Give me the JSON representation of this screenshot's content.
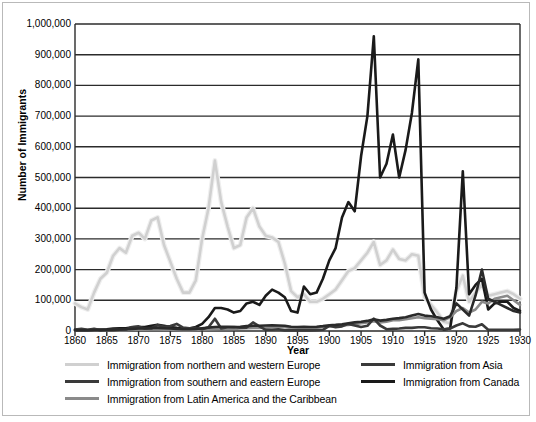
{
  "chart_data": {
    "type": "line",
    "title": "",
    "xlabel": "Year",
    "ylabel": "Number of Immigrants",
    "xlim": [
      1860,
      1930
    ],
    "ylim": [
      0,
      1000000
    ],
    "grid": true,
    "legend_position": "bottom",
    "yticks": [
      "0",
      "100,000",
      "200,000",
      "300,000",
      "400,000",
      "500,000",
      "600,000",
      "700,000",
      "800,000",
      "900,000",
      "1,000,000"
    ],
    "ytick_values": [
      0,
      100000,
      200000,
      300000,
      400000,
      500000,
      600000,
      700000,
      800000,
      900000,
      1000000
    ],
    "xticks": [
      "1860",
      "1865",
      "1870",
      "1875",
      "1880",
      "1885",
      "1890",
      "1895",
      "1900",
      "1905",
      "1910",
      "1915",
      "1920",
      "1925",
      "1930"
    ],
    "xtick_values": [
      1860,
      1865,
      1870,
      1875,
      1880,
      1885,
      1890,
      1895,
      1900,
      1905,
      1910,
      1915,
      1920,
      1925,
      1930
    ],
    "x": [
      1860,
      1861,
      1862,
      1863,
      1864,
      1865,
      1866,
      1867,
      1868,
      1869,
      1870,
      1871,
      1872,
      1873,
      1874,
      1875,
      1876,
      1877,
      1878,
      1879,
      1880,
      1881,
      1882,
      1883,
      1884,
      1885,
      1886,
      1887,
      1888,
      1889,
      1890,
      1891,
      1892,
      1893,
      1894,
      1895,
      1896,
      1897,
      1898,
      1899,
      1900,
      1901,
      1902,
      1903,
      1904,
      1905,
      1906,
      1907,
      1908,
      1909,
      1910,
      1911,
      1912,
      1913,
      1914,
      1915,
      1916,
      1917,
      1918,
      1919,
      1920,
      1921,
      1922,
      1923,
      1924,
      1925,
      1926,
      1927,
      1928,
      1929,
      1930
    ],
    "series": [
      {
        "name": "Immigration from northern and western Europe",
        "color": "#d0d0d0",
        "width": 2.6,
        "values": [
          90000,
          78000,
          70000,
          125000,
          170000,
          190000,
          245000,
          270000,
          255000,
          310000,
          320000,
          300000,
          360000,
          370000,
          280000,
          225000,
          170000,
          125000,
          125000,
          165000,
          300000,
          400000,
          555000,
          420000,
          340000,
          270000,
          280000,
          370000,
          400000,
          340000,
          310000,
          305000,
          290000,
          220000,
          130000,
          110000,
          120000,
          95000,
          95000,
          105000,
          120000,
          135000,
          165000,
          195000,
          205000,
          230000,
          255000,
          290000,
          215000,
          230000,
          265000,
          235000,
          230000,
          250000,
          245000,
          110000,
          85000,
          60000,
          30000,
          25000,
          130000,
          180000,
          95000,
          125000,
          150000,
          115000,
          120000,
          125000,
          130000,
          120000,
          105000
        ]
      },
      {
        "name": "Immigration from southern and eastern Europe",
        "color": "#1a1a1a",
        "width": 2.6,
        "values": [
          4000,
          4000,
          3000,
          4000,
          5000,
          6000,
          8000,
          9000,
          9000,
          12000,
          13000,
          13000,
          17000,
          20000,
          17000,
          13000,
          10000,
          8000,
          8000,
          13000,
          23000,
          45000,
          75000,
          75000,
          70000,
          60000,
          65000,
          90000,
          95000,
          85000,
          115000,
          135000,
          125000,
          110000,
          65000,
          60000,
          145000,
          120000,
          125000,
          170000,
          230000,
          270000,
          370000,
          420000,
          390000,
          570000,
          700000,
          960000,
          500000,
          545000,
          640000,
          500000,
          590000,
          710000,
          885000,
          125000,
          70000,
          35000,
          5000,
          8000,
          140000,
          520000,
          120000,
          150000,
          170000,
          70000,
          90000,
          95000,
          95000,
          75000,
          65000
        ]
      },
      {
        "name": "Immigration from Latin America and the Caribbean",
        "color": "#8a8a8a",
        "width": 2.6,
        "values": [
          1500,
          1500,
          1500,
          2000,
          2000,
          2500,
          3000,
          3000,
          3000,
          4000,
          4000,
          4000,
          5000,
          5000,
          4500,
          4000,
          3500,
          3000,
          3000,
          3500,
          4000,
          5000,
          6000,
          7000,
          7000,
          7000,
          8000,
          9000,
          10000,
          10000,
          11000,
          12000,
          12000,
          12000,
          10000,
          10000,
          11000,
          10000,
          11000,
          13000,
          15000,
          16000,
          18000,
          20000,
          22000,
          25000,
          28000,
          32000,
          28000,
          30000,
          35000,
          35000,
          38000,
          42000,
          45000,
          42000,
          40000,
          38000,
          35000,
          45000,
          65000,
          75000,
          60000,
          70000,
          95000,
          90000,
          105000,
          110000,
          115000,
          100000,
          85000
        ]
      },
      {
        "name": "Immigration from Asia",
        "color": "#3a3a3a",
        "width": 2.6,
        "values": [
          5000,
          7000,
          4000,
          7000,
          3000,
          3000,
          3000,
          4000,
          5000,
          13000,
          15000,
          8000,
          8000,
          20000,
          14000,
          16000,
          23000,
          11000,
          9000,
          10000,
          6000,
          12000,
          40000,
          8000,
          12000,
          13000,
          11000,
          11000,
          28000,
          15000,
          4000,
          4000,
          6000,
          2000,
          2000,
          2000,
          2000,
          2000,
          3000,
          4000,
          17000,
          12000,
          15000,
          23000,
          18000,
          13000,
          17000,
          40000,
          18000,
          6000,
          7000,
          8000,
          10000,
          10000,
          12000,
          12000,
          9000,
          8000,
          6000,
          8000,
          18000,
          25000,
          15000,
          14000,
          22000,
          4000,
          4000,
          4000,
          4000,
          4000,
          5000
        ]
      },
      {
        "name": "Immigration from Canada",
        "color": "#2a2a2a",
        "width": 2.6,
        "values": [
          2000,
          2000,
          2000,
          3000,
          3000,
          4000,
          5000,
          6000,
          6000,
          7000,
          8000,
          8000,
          10000,
          10000,
          9000,
          8000,
          7000,
          6000,
          6000,
          7000,
          9000,
          11000,
          13000,
          14000,
          14000,
          13000,
          14000,
          16000,
          17000,
          17000,
          18000,
          19000,
          18000,
          17000,
          14000,
          13000,
          14000,
          13000,
          14000,
          16000,
          19000,
          20000,
          22000,
          25000,
          28000,
          30000,
          33000,
          38000,
          34000,
          36000,
          40000,
          42000,
          45000,
          50000,
          55000,
          50000,
          48000,
          45000,
          40000,
          48000,
          90000,
          70000,
          50000,
          115000,
          200000,
          105000,
          95000,
          85000,
          75000,
          65000,
          60000
        ]
      }
    ]
  },
  "legend": {
    "left_column": [
      {
        "label": "Immigration from northern and western Europe",
        "color": "#d0d0d0"
      },
      {
        "label": "Immigration from southern and eastern Europe",
        "color": "#3a3a3a"
      },
      {
        "label": "Immigration from Latin America and the Caribbean",
        "color": "#8a8a8a"
      }
    ],
    "right_column": [
      {
        "label": "Immigration from Asia",
        "color": "#3a3a3a"
      },
      {
        "label": "Immigration from Canada",
        "color": "#1a1a1a"
      }
    ]
  },
  "axes": {
    "x_title": "Year",
    "y_title": "Number of Immigrants"
  },
  "style": {
    "grid_color": "#2b2b2b",
    "frame_color": "#b9b9b9",
    "background": "#ffffff"
  }
}
